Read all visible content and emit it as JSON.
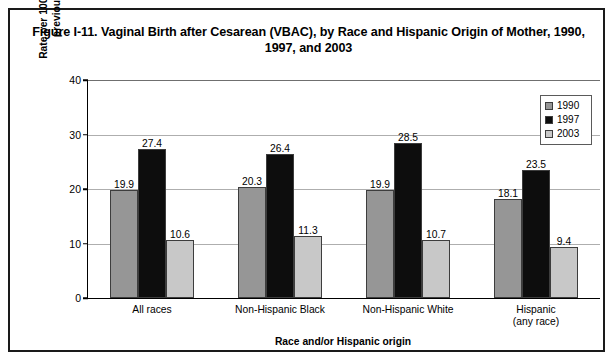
{
  "figure": {
    "title": "Figure I-11. Vaginal Birth after Cesarean (VBAC), by Race and Hispanic Origin of Mother, 1990, 1997, and 2003"
  },
  "colors": {
    "series_1990": "#969696",
    "series_1997": "#0d0d0d",
    "series_2003": "#c8c8c8",
    "gridline": "#aeaeae",
    "axis": "#000000",
    "frame": "#1a1a1a",
    "background": "#ffffff"
  },
  "legend": {
    "position": "top-right",
    "entries": [
      {
        "label": "1990",
        "color": "#969696"
      },
      {
        "label": "1997",
        "color": "#0d0d0d"
      },
      {
        "label": "2003",
        "color": "#c8c8c8"
      }
    ]
  },
  "axes": {
    "y_title_line1": "Rate per 100 births to women with a",
    "y_title_line2": "previous cesarean delivery",
    "x_title": "Race and/or Hispanic origin",
    "y_ticks": [
      "0",
      "10",
      "20",
      "30",
      "40"
    ]
  },
  "chart_data": {
    "type": "bar",
    "title": "Figure I-11. Vaginal Birth after Cesarean (VBAC), by Race and Hispanic Origin of Mother, 1990, 1997, and 2003",
    "xlabel": "Race and/or Hispanic origin",
    "ylabel": "Rate per 100 births to women with a previous cesarean delivery",
    "ylim": [
      0,
      40
    ],
    "yticks": [
      0,
      10,
      20,
      30,
      40
    ],
    "grid": true,
    "legend_position": "upper right",
    "categories": [
      "All races",
      "Non-Hispanic Black",
      "Non-Hispanic White",
      "Hispanic (any race)"
    ],
    "category_lines": [
      [
        "All races"
      ],
      [
        "Non-Hispanic Black"
      ],
      [
        "Non-Hispanic White"
      ],
      [
        "Hispanic",
        "(any race)"
      ]
    ],
    "series": [
      {
        "name": "1990",
        "color": "#969696",
        "values": [
          19.9,
          20.3,
          19.9,
          18.1
        ],
        "labels": [
          "19.9",
          "20.3",
          "19.9",
          "18.1"
        ]
      },
      {
        "name": "1997",
        "color": "#0d0d0d",
        "values": [
          27.4,
          26.4,
          28.5,
          23.5
        ],
        "labels": [
          "27.4",
          "26.4",
          "28.5",
          "23.5"
        ]
      },
      {
        "name": "2003",
        "color": "#c8c8c8",
        "values": [
          10.6,
          11.3,
          10.7,
          9.4
        ],
        "labels": [
          "10.6",
          "11.3",
          "10.7",
          "9.4"
        ]
      }
    ]
  }
}
